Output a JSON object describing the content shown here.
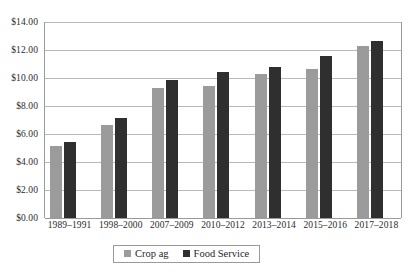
{
  "chart_data": {
    "type": "bar",
    "title": "",
    "subtitle": "",
    "xlabel": "",
    "ylabel": "",
    "categories": [
      "1989–1991",
      "1998–2000",
      "2007–2009",
      "2010–2012",
      "2013–2014",
      "2015–2016",
      "2017–2018"
    ],
    "series": [
      {
        "name": "Crop ag",
        "color": "#9b9b9b",
        "values": [
          5.15,
          6.65,
          9.3,
          9.45,
          10.3,
          10.65,
          12.3
        ]
      },
      {
        "name": "Food Service",
        "color": "#2f2f2f",
        "values": [
          5.45,
          7.15,
          9.85,
          10.4,
          10.8,
          11.6,
          12.65
        ]
      }
    ],
    "ylim": [
      0,
      14
    ],
    "ytick_step": 2,
    "ytick_labels": [
      "$0.00",
      "$2.00",
      "$4.00",
      "$6.00",
      "$8.00",
      "$10.00",
      "$12.00",
      "$14.00"
    ],
    "ytick_values": [
      0,
      2,
      4,
      6,
      8,
      10,
      12,
      14
    ],
    "grid": true,
    "grid_axis": "y",
    "legend_position": "bottom-center",
    "legend": [
      "Crop ag",
      "Food Service"
    ]
  },
  "colors": {
    "series_crop_ag": "#9b9b9b",
    "series_food_service": "#2f2f2f",
    "gridline": "#b9b9b9",
    "axis": "#9a9a9a",
    "text": "#2b2b2b",
    "background": "#ffffff"
  }
}
